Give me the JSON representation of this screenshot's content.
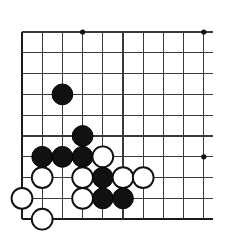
{
  "figure": {
    "kind": "go-board-diagram"
  },
  "board": {
    "columns": 10,
    "rows": 10,
    "origin_x": 22,
    "origin_y": 32,
    "spacing_x": 20.2,
    "spacing_y": 20.8,
    "line_color": "#3a3a3a",
    "edge_color": "#1a1a1a",
    "background_color": "#ffffff",
    "line_overhang_right": 9,
    "edge_left": true,
    "edge_bottom": true,
    "star_points": [
      {
        "col": 4,
        "row": 1
      },
      {
        "col": 10,
        "row": 1
      },
      {
        "col": 10,
        "row": 7
      }
    ]
  },
  "stones": {
    "black_color": "#111111",
    "white_color": "#ffffff",
    "white_outline_color": "#111111",
    "radius": 10.4,
    "black_count": 9,
    "white_count": 9,
    "list": [
      {
        "col": 3,
        "row": 4,
        "color": "black"
      },
      {
        "col": 4,
        "row": 6,
        "color": "black"
      },
      {
        "col": 2,
        "row": 7,
        "color": "black"
      },
      {
        "col": 3,
        "row": 7,
        "color": "black"
      },
      {
        "col": 4,
        "row": 7,
        "color": "black"
      },
      {
        "col": 5,
        "row": 7,
        "color": "white"
      },
      {
        "col": 2,
        "row": 8,
        "color": "white"
      },
      {
        "col": 4,
        "row": 8,
        "color": "white"
      },
      {
        "col": 5,
        "row": 8,
        "color": "black"
      },
      {
        "col": 6,
        "row": 8,
        "color": "white"
      },
      {
        "col": 7,
        "row": 8,
        "color": "white"
      },
      {
        "col": 1,
        "row": 9,
        "color": "white"
      },
      {
        "col": 4,
        "row": 9,
        "color": "white"
      },
      {
        "col": 5,
        "row": 9,
        "color": "black"
      },
      {
        "col": 6,
        "row": 9,
        "color": "black"
      },
      {
        "col": 2,
        "row": 10,
        "color": "white"
      }
    ]
  }
}
